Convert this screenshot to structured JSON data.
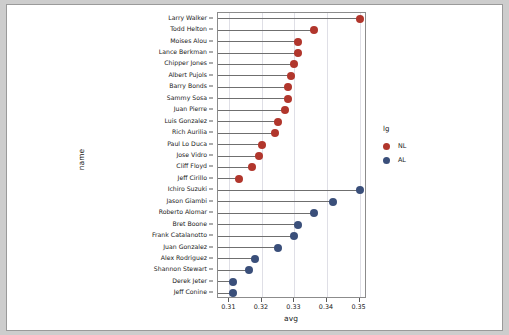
{
  "chart_data": {
    "type": "scatter",
    "subtype": "lollipop",
    "title": "",
    "xlabel": "avg",
    "ylabel": "name",
    "xlim": [
      0.3065,
      0.3523
    ],
    "xticks": [
      0.31,
      0.32,
      0.33,
      0.34,
      0.35
    ],
    "xticklabels": [
      "0.31",
      "0.32",
      "0.33",
      "0.34",
      "0.35"
    ],
    "grid": "vertical",
    "legend": {
      "title": "lg",
      "position": "right",
      "entries": [
        {
          "label": "NL",
          "color": "#b1362c"
        },
        {
          "label": "AL",
          "color": "#3a4f7a"
        }
      ]
    },
    "categories": [
      "Larry Walker",
      "Todd Helton",
      "Moises Alou",
      "Lance Berkman",
      "Chipper Jones",
      "Albert Pujols",
      "Barry Bonds",
      "Sammy Sosa",
      "Juan Pierre",
      "Luis Gonzalez",
      "Rich Aurilia",
      "Paul Lo Duca",
      "Jose Vidro",
      "Cliff Floyd",
      "Jeff Cirillo",
      "Ichiro Suzuki",
      "Jason Giambi",
      "Roberto Alomar",
      "Bret Boone",
      "Frank Catalanotto",
      "Juan Gonzalez",
      "Alex Rodriguez",
      "Shannon Stewart",
      "Derek Jeter",
      "Jeff Conine"
    ],
    "points": [
      {
        "name": "Larry Walker",
        "avg": 0.35,
        "lg": "NL"
      },
      {
        "name": "Todd Helton",
        "avg": 0.336,
        "lg": "NL"
      },
      {
        "name": "Moises Alou",
        "avg": 0.331,
        "lg": "NL"
      },
      {
        "name": "Lance Berkman",
        "avg": 0.331,
        "lg": "NL"
      },
      {
        "name": "Chipper Jones",
        "avg": 0.33,
        "lg": "NL"
      },
      {
        "name": "Albert Pujols",
        "avg": 0.329,
        "lg": "NL"
      },
      {
        "name": "Barry Bonds",
        "avg": 0.328,
        "lg": "NL"
      },
      {
        "name": "Sammy Sosa",
        "avg": 0.328,
        "lg": "NL"
      },
      {
        "name": "Juan Pierre",
        "avg": 0.327,
        "lg": "NL"
      },
      {
        "name": "Luis Gonzalez",
        "avg": 0.325,
        "lg": "NL"
      },
      {
        "name": "Rich Aurilia",
        "avg": 0.324,
        "lg": "NL"
      },
      {
        "name": "Paul Lo Duca",
        "avg": 0.32,
        "lg": "NL"
      },
      {
        "name": "Jose Vidro",
        "avg": 0.319,
        "lg": "NL"
      },
      {
        "name": "Cliff Floyd",
        "avg": 0.317,
        "lg": "NL"
      },
      {
        "name": "Jeff Cirillo",
        "avg": 0.313,
        "lg": "NL"
      },
      {
        "name": "Ichiro Suzuki",
        "avg": 0.35,
        "lg": "AL"
      },
      {
        "name": "Jason Giambi",
        "avg": 0.342,
        "lg": "AL"
      },
      {
        "name": "Roberto Alomar",
        "avg": 0.336,
        "lg": "AL"
      },
      {
        "name": "Bret Boone",
        "avg": 0.331,
        "lg": "AL"
      },
      {
        "name": "Frank Catalanotto",
        "avg": 0.33,
        "lg": "AL"
      },
      {
        "name": "Juan Gonzalez",
        "avg": 0.325,
        "lg": "AL"
      },
      {
        "name": "Alex Rodriguez",
        "avg": 0.318,
        "lg": "AL"
      },
      {
        "name": "Shannon Stewart",
        "avg": 0.316,
        "lg": "AL"
      },
      {
        "name": "Derek Jeter",
        "avg": 0.311,
        "lg": "AL"
      },
      {
        "name": "Jeff Conine",
        "avg": 0.311,
        "lg": "AL"
      }
    ]
  },
  "legend": {
    "title": "lg",
    "nl_label": "NL",
    "al_label": "AL"
  },
  "axes": {
    "x_title": "avg",
    "y_title": "name"
  }
}
